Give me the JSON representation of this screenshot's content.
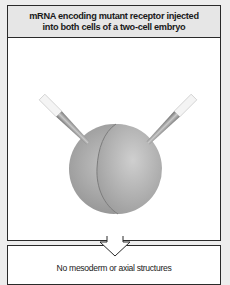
{
  "header": {
    "line1": "mRNA encoding mutant receptor injected",
    "line2": "into both cells of a two-cell embryo"
  },
  "diagram": {
    "subject": "two-cell embryo",
    "injection_needles": [
      "left-needle",
      "right-needle"
    ],
    "colors": {
      "embryo": "#a8a8a8",
      "needle_shaft": "#8a8a8a",
      "needle_tip": "#f4f4f4",
      "border": "#2a2a2a",
      "header_bg": "#e6e6e6",
      "page_bg": "#ededed"
    }
  },
  "result": {
    "text": "No mesoderm or axial structures"
  }
}
